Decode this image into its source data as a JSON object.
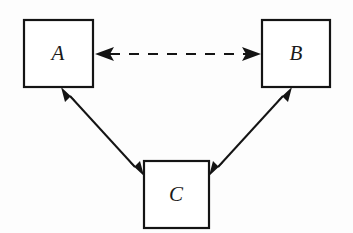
{
  "diagram": {
    "background_color": "#fdfdfd",
    "stroke_color": "#141414",
    "nodes": [
      {
        "id": "A",
        "label": "A",
        "shape": "square",
        "x": 24,
        "y": 20,
        "width": 69,
        "height": 67,
        "label_x": 58,
        "label_y": 54
      },
      {
        "id": "B",
        "label": "B",
        "shape": "square",
        "x": 262,
        "y": 20,
        "width": 68,
        "height": 67,
        "label_x": 296,
        "label_y": 54
      },
      {
        "id": "C",
        "label": "C",
        "shape": "square",
        "x": 144,
        "y": 161,
        "width": 65,
        "height": 67,
        "label_x": 176,
        "label_y": 194
      }
    ],
    "edges": [
      {
        "id": "A-B",
        "from": "A",
        "to": "B",
        "style": "dashed",
        "arrowheads": "both",
        "x1": 95,
        "y1": 54,
        "x2": 260,
        "y2": 54
      },
      {
        "id": "A-C",
        "from": "A",
        "to": "C",
        "style": "solid",
        "arrowheads": "both",
        "x1": 62,
        "y1": 88,
        "x2": 143,
        "y2": 175
      },
      {
        "id": "B-C",
        "from": "B",
        "to": "C",
        "style": "solid",
        "arrowheads": "both",
        "x1": 291,
        "y1": 88,
        "x2": 211,
        "y2": 175
      }
    ]
  }
}
